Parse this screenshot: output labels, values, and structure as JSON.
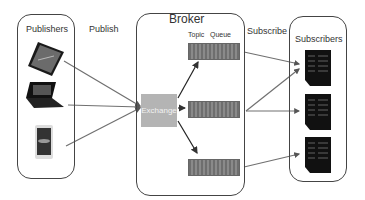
{
  "diagram": {
    "publishers": {
      "title": "Publishers",
      "devices": [
        "tablet",
        "laptop",
        "smartphone"
      ]
    },
    "publish_label": "Publish",
    "broker": {
      "title": "Broker",
      "topic_label": "Topic",
      "queue_label": "Queue",
      "exchange_label": "Exchange",
      "queues": [
        "queue-1",
        "queue-2",
        "queue-3"
      ]
    },
    "subscribe_label": "Subscribe",
    "subscribers": {
      "title": "Subscribers",
      "devices": [
        "server",
        "server",
        "server"
      ]
    },
    "colors": {
      "line": "#707070",
      "arrow": "#222222",
      "border": "#444444",
      "exchange": "#b4b4b4",
      "queue": "#7a7a7a"
    }
  }
}
